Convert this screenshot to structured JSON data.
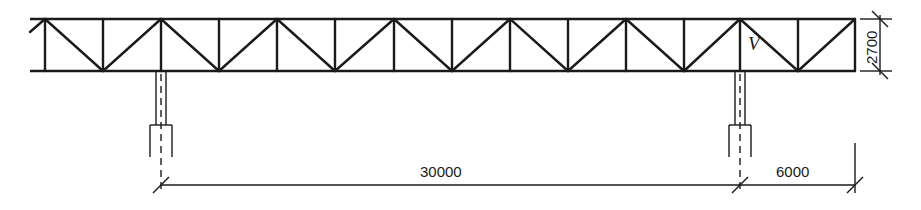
{
  "diagram": {
    "type": "truss elevation",
    "truss": {
      "top_chord_y": 19,
      "bottom_chord_y": 71,
      "x_start": 30,
      "x_end": 855,
      "panel_points_x": [
        45,
        103,
        161,
        219,
        277,
        335,
        394,
        452,
        510,
        568,
        626,
        684,
        740,
        798,
        855
      ],
      "member_label": "V",
      "member_label_position": {
        "x": 748,
        "y": 50
      }
    },
    "columns": [
      {
        "name": "left-column",
        "x": 161
      },
      {
        "name": "right-column",
        "x": 740
      }
    ],
    "dimensions": {
      "span": "30000",
      "cantilever": "6000",
      "depth": "2700"
    },
    "colors": {
      "line": "#1a1a1a",
      "background": "#ffffff"
    }
  }
}
